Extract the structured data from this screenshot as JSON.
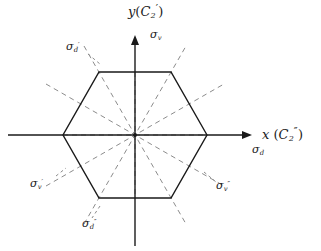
{
  "figure": {
    "colors": {
      "background": "#ffffff",
      "axis": "#1a1a1a",
      "hexagon": "#1a1a1a",
      "mirror_dashed": "#8c8c8c",
      "label": "#1a1a1a"
    },
    "geometry": {
      "center": [
        135,
        135
      ],
      "hexagon_circumradius": 72,
      "hexagon_vertices": [
        [
          207,
          135
        ],
        [
          171,
          72
        ],
        [
          99,
          72
        ],
        [
          63,
          135
        ],
        [
          99,
          198
        ],
        [
          171,
          198
        ]
      ],
      "x_axis": [
        8,
        135,
        252,
        135
      ],
      "y_axis": [
        135,
        245,
        135,
        36
      ],
      "mirror_lines_deg": [
        0,
        30,
        60,
        90,
        120,
        150
      ]
    }
  },
  "labels": {
    "y_axis": {
      "sym": "y",
      "paren_open": "(",
      "c2": "C",
      "c2_sub": "2",
      "c2_prime": "′",
      "paren_close": ")"
    },
    "x_axis": {
      "sym": "x",
      "paren_open": "(",
      "c2": "C",
      "c2_sub": "2",
      "c2_prime": "″",
      "paren_close": ")"
    },
    "sigma_v": {
      "sym": "σ",
      "sub": "v",
      "prime": ""
    },
    "sigma_d": {
      "sym": "σ",
      "sub": "d",
      "prime": ""
    },
    "sigma_v_p": {
      "sym": "σ",
      "sub": "v",
      "prime": "′"
    },
    "sigma_v_pp": {
      "sym": "σ",
      "sub": "v",
      "prime": "″"
    },
    "sigma_d_p": {
      "sym": "σ",
      "sub": "d",
      "prime": "′"
    },
    "sigma_d_pp": {
      "sym": "σ",
      "sub": "d",
      "prime": "″"
    }
  }
}
